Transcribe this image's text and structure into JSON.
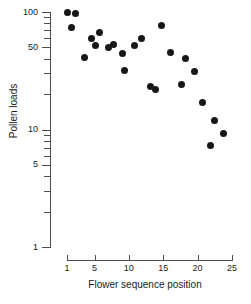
{
  "chart_data": {
    "type": "scatter",
    "title": "",
    "xlabel": "Flower sequence position",
    "ylabel": "Pollen loads",
    "xlim": [
      1,
      25
    ],
    "ylim": [
      1,
      100
    ],
    "yscale": "log",
    "xscale": "linear",
    "grid": false,
    "legend": null,
    "x_ticks": [
      1,
      5,
      10,
      15,
      20,
      25
    ],
    "x_tick_labels": [
      "1",
      "5",
      "10",
      "15",
      "20",
      "25"
    ],
    "y_ticks": [
      1,
      5,
      10,
      50,
      100
    ],
    "y_tick_labels": [
      "1",
      "5",
      "10",
      "50",
      "100"
    ],
    "y_minor_ticks": [
      2,
      3,
      4,
      6,
      7,
      8,
      9,
      20,
      30,
      40,
      60,
      70,
      80,
      90
    ],
    "marker": "filled-circle",
    "marker_color": "#171717",
    "marker_size": 7,
    "points": [
      {
        "x": 1.0,
        "y": 100
      },
      {
        "x": 2.3,
        "y": 97
      },
      {
        "x": 1.6,
        "y": 74
      },
      {
        "x": 3.5,
        "y": 41
      },
      {
        "x": 4.6,
        "y": 60
      },
      {
        "x": 5.7,
        "y": 67
      },
      {
        "x": 5.1,
        "y": 52
      },
      {
        "x": 7.0,
        "y": 50
      },
      {
        "x": 7.7,
        "y": 53
      },
      {
        "x": 9.0,
        "y": 44
      },
      {
        "x": 9.3,
        "y": 32
      },
      {
        "x": 10.8,
        "y": 52
      },
      {
        "x": 11.9,
        "y": 60
      },
      {
        "x": 13.2,
        "y": 23
      },
      {
        "x": 13.9,
        "y": 22
      },
      {
        "x": 14.8,
        "y": 77
      },
      {
        "x": 16.0,
        "y": 45
      },
      {
        "x": 17.6,
        "y": 24
      },
      {
        "x": 18.2,
        "y": 40
      },
      {
        "x": 19.6,
        "y": 31
      },
      {
        "x": 20.7,
        "y": 17
      },
      {
        "x": 21.8,
        "y": 7.3
      },
      {
        "x": 22.5,
        "y": 12
      },
      {
        "x": 23.7,
        "y": 9.2
      }
    ]
  },
  "axis_titles": {
    "x": "Flower sequence position",
    "y": "Pollen loads"
  }
}
